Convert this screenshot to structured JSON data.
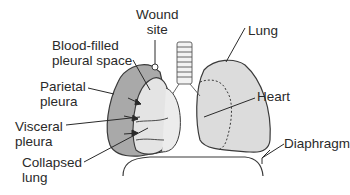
{
  "figure": {
    "labels": {
      "wound_site": "Wound\nsite",
      "lung": "Lung",
      "blood_filled": "Blood-filled\npleural space",
      "parietal": "Parietal\npleura",
      "heart": "Heart",
      "visceral": "Visceral\npleura",
      "diaphragm": "Diaphragm",
      "collapsed": "Collapsed\nlung"
    },
    "colors": {
      "blood_space": "#a9a9a9",
      "lung_fill": "#dcdcdc",
      "collapsed_fill": "#e4e4e4",
      "outline": "#3a3a3a",
      "leader": "#2a2a2a"
    }
  }
}
